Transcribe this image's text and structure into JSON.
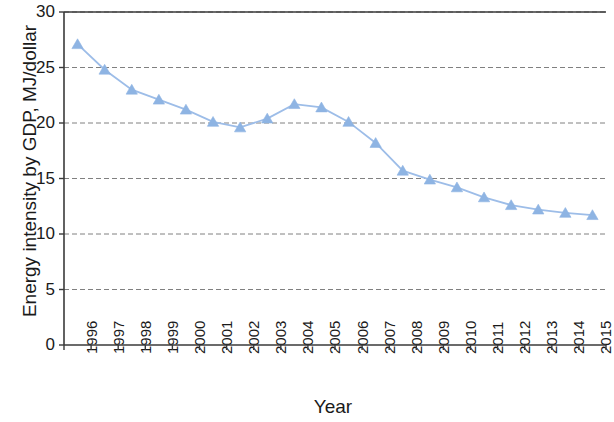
{
  "chart_data": {
    "type": "line",
    "title": "",
    "xlabel": "Year",
    "ylabel": "Energy intensity by GDP, MJ/dollar",
    "categories": [
      "1996",
      "1997",
      "1998",
      "1999",
      "2000",
      "2001",
      "2002",
      "2003",
      "2004",
      "2005",
      "2006",
      "2007",
      "2008",
      "2009",
      "2010",
      "2011",
      "2012",
      "2013",
      "2014",
      "2015"
    ],
    "values": [
      27.1,
      24.8,
      23.0,
      22.1,
      21.2,
      20.1,
      19.6,
      20.4,
      21.7,
      21.4,
      20.1,
      18.2,
      15.7,
      14.9,
      14.2,
      13.3,
      12.6,
      12.2,
      11.9,
      11.7
    ],
    "series": [
      {
        "name": "Energy intensity by GDP",
        "values": [
          27.1,
          24.8,
          23.0,
          22.1,
          21.2,
          20.1,
          19.6,
          20.4,
          21.7,
          21.4,
          20.1,
          18.2,
          15.7,
          14.9,
          14.2,
          13.3,
          12.6,
          12.2,
          11.9,
          11.7
        ],
        "marker": "triangle",
        "color": "#8EB4E3"
      }
    ],
    "ylim": [
      0,
      30
    ],
    "ytick_values": [
      0,
      5,
      10,
      15,
      20,
      25,
      30
    ],
    "ytick_labels": [
      "0",
      "5",
      "10",
      "15",
      "20",
      "25",
      "30"
    ],
    "grid": "horizontal-dashed",
    "legend": "none",
    "xtick_label_rotation": 90,
    "colors": {
      "series": "#8EB4E3",
      "line": "#9DBDE8",
      "gridline": "#808080",
      "axis": "#3a3a3a",
      "text": "#1a1a1a",
      "background": "#ffffff"
    }
  }
}
